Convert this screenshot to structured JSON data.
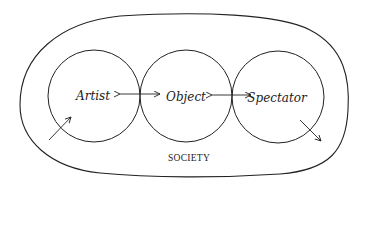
{
  "diagram": {
    "container_label": "SOCIETY",
    "nodes": [
      {
        "id": "artist",
        "label": "Artist"
      },
      {
        "id": "object",
        "label": "Object"
      },
      {
        "id": "spectator",
        "label": "Spectator"
      }
    ],
    "edges": [
      {
        "from": "artist",
        "to": "object",
        "type": "bidirectional-arrow"
      },
      {
        "from": "object",
        "to": "spectator",
        "type": "bidirectional-arrow"
      },
      {
        "from": "society",
        "to": "artist",
        "type": "arrow-in"
      },
      {
        "from": "spectator",
        "to": "society",
        "type": "arrow-out"
      }
    ],
    "colors": {
      "stroke": "#222222",
      "background": "#ffffff"
    }
  }
}
